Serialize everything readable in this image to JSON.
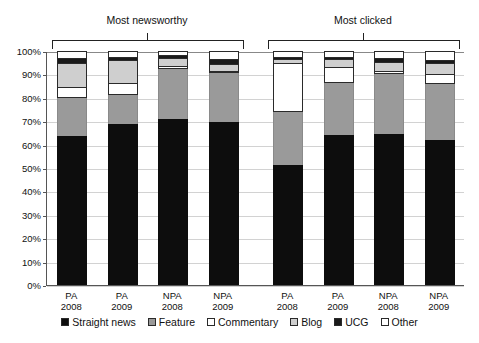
{
  "groups": [
    {
      "label": "Most newsworthy"
    },
    {
      "label": "Most clicked"
    }
  ],
  "legend": [
    {
      "label": "Straight news",
      "color": "#0d0d0d"
    },
    {
      "label": "Feature",
      "color": "#9a9a9a"
    },
    {
      "label": "Commentary",
      "color": "#ffffff"
    },
    {
      "label": "Blog",
      "color": "#cfcfcf"
    },
    {
      "label": "UCG",
      "color": "#1a1a1a"
    },
    {
      "label": "Other",
      "color": "#ffffff"
    }
  ],
  "chart_data": {
    "type": "bar",
    "subtype": "stacked-percentage",
    "title": "",
    "xlabel": "",
    "ylabel": "",
    "ylim": [
      0,
      100
    ],
    "ytick_labels": [
      "0%",
      "10%",
      "20%",
      "30%",
      "40%",
      "50%",
      "60%",
      "70%",
      "80%",
      "90%",
      "100%"
    ],
    "ytick_values": [
      0,
      10,
      20,
      30,
      40,
      50,
      60,
      70,
      80,
      90,
      100
    ],
    "grid": true,
    "legend_position": "bottom",
    "groups": [
      "Most newsworthy",
      "Most clicked"
    ],
    "categories": [
      "PA\n2008",
      "PA\n2009",
      "NPA\n2008",
      "NPA\n2009",
      "PA\n2008",
      "PA\n2009",
      "NPA\n2008",
      "NPA\n2009"
    ],
    "series": [
      {
        "name": "Straight news",
        "color": "#0d0d0d",
        "values": [
          63.5,
          69.0,
          71.0,
          69.5,
          51.5,
          64.0,
          64.5,
          62.0
        ]
      },
      {
        "name": "Feature",
        "color": "#9a9a9a",
        "values": [
          16.5,
          12.0,
          21.5,
          21.0,
          22.5,
          22.5,
          25.5,
          24.0
        ]
      },
      {
        "name": "Commentary",
        "color": "#ffffff",
        "values": [
          4.5,
          5.5,
          1.0,
          1.0,
          21.0,
          6.5,
          1.5,
          4.0
        ]
      },
      {
        "name": "Blog",
        "color": "#cfcfcf",
        "values": [
          10.5,
          9.5,
          3.5,
          3.0,
          1.5,
          3.5,
          4.0,
          5.0
        ]
      },
      {
        "name": "UCG",
        "color": "#1a1a1a",
        "values": [
          2.0,
          1.5,
          1.5,
          2.0,
          1.0,
          1.0,
          1.5,
          1.0
        ]
      },
      {
        "name": "Other",
        "color": "#ffffff",
        "values": [
          3.0,
          2.5,
          1.5,
          3.5,
          2.5,
          2.5,
          3.0,
          4.0
        ]
      }
    ]
  }
}
